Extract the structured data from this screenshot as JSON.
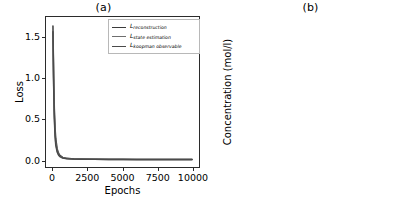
{
  "figure": {
    "panel_a_title": "(a)",
    "panel_b_title": "(b)"
  },
  "chart_data": [
    {
      "type": "line",
      "title": "(a)",
      "xlabel": "Epochs",
      "ylabel": "Loss",
      "xlim": [
        -500,
        10500
      ],
      "ylim": [
        -0.09,
        1.75
      ],
      "xticks": [
        0,
        2500,
        5000,
        7500,
        10000
      ],
      "xtick_labels": [
        "0",
        "2500",
        "5000",
        "7500",
        "10000"
      ],
      "yticks": [
        0.0,
        0.5,
        1.0,
        1.5
      ],
      "ytick_labels": [
        "0.0",
        "0.5",
        "1.0",
        "1.5"
      ],
      "grid": false,
      "legend_position": "upper right",
      "series": [
        {
          "name": "L_reconstruction",
          "label_base": "L",
          "label_sub": "reconstruction",
          "color": "#3b3b3b",
          "x": [
            0,
            50,
            100,
            150,
            200,
            300,
            400,
            500,
            700,
            1000,
            1500,
            2000,
            3000,
            4000,
            5000,
            6000,
            7000,
            8000,
            9000,
            10000
          ],
          "y": [
            1.64,
            1.02,
            0.62,
            0.39,
            0.26,
            0.135,
            0.08,
            0.052,
            0.028,
            0.016,
            0.009,
            0.007,
            0.005,
            0.004,
            0.004,
            0.003,
            0.003,
            0.003,
            0.003,
            0.003
          ]
        },
        {
          "name": "L_state estimation",
          "label_base": "L",
          "label_sub": "state estimation",
          "color": "#6e6e6e",
          "x": [
            0,
            50,
            100,
            150,
            200,
            300,
            400,
            500,
            700,
            1000,
            1500,
            2000,
            3000,
            4000,
            5000,
            6000,
            7000,
            8000,
            9000,
            10000
          ],
          "y": [
            1.6,
            0.95,
            0.55,
            0.33,
            0.21,
            0.11,
            0.065,
            0.043,
            0.023,
            0.013,
            0.008,
            0.006,
            0.004,
            0.003,
            0.003,
            0.003,
            0.002,
            0.002,
            0.002,
            0.002
          ]
        },
        {
          "name": "L_koopman observable",
          "label_base": "L",
          "label_sub": "koopman observable",
          "color": "#4a4a4a",
          "x": [
            0,
            50,
            100,
            150,
            200,
            300,
            400,
            500,
            700,
            1000,
            1500,
            2000,
            3000,
            4000,
            5000,
            6000,
            7000,
            8000,
            9000,
            10000
          ],
          "y": [
            1.57,
            0.9,
            0.5,
            0.29,
            0.18,
            0.095,
            0.057,
            0.037,
            0.02,
            0.012,
            0.007,
            0.005,
            0.004,
            0.003,
            0.003,
            0.002,
            0.002,
            0.002,
            0.002,
            0.002
          ]
        }
      ]
    },
    {
      "type": "line",
      "title": "(b)",
      "xlabel": "Time (s)",
      "ylabel": "Concentration (mol/l)",
      "xlim": [
        -1.5,
        31.5
      ],
      "ylim": [
        -0.05,
        1.07
      ],
      "xticks": [
        0,
        10,
        20,
        30
      ],
      "xtick_labels": [
        "0",
        "10",
        "20",
        "30"
      ],
      "yticks": [
        0.0,
        0.2,
        0.4,
        0.6,
        0.8,
        1.0
      ],
      "ytick_labels": [
        "0.0",
        "0.2",
        "0.4",
        "0.6",
        "0.8",
        "1.0"
      ],
      "grid": false,
      "legend_position": "upper right",
      "series": [
        {
          "name": "C_A predicted",
          "label_base": "C",
          "label_sub": "A",
          "label_tail": " predicted",
          "color": "#3b3b3b",
          "x": [
            0,
            0.5,
            1,
            1.5,
            2,
            3,
            4,
            5,
            6,
            8,
            10,
            12,
            14,
            16,
            18,
            20,
            24,
            27,
            30
          ],
          "y": [
            1.0,
            0.945,
            0.897,
            0.857,
            0.823,
            0.773,
            0.738,
            0.713,
            0.696,
            0.675,
            0.663,
            0.655,
            0.65,
            0.647,
            0.645,
            0.643,
            0.641,
            0.64,
            0.639
          ]
        },
        {
          "name": "C_A actual",
          "label_base": "C",
          "label_sub": "A",
          "label_tail": " actual",
          "color": "#777777",
          "x": [
            0,
            0.5,
            1,
            1.5,
            2,
            3,
            4,
            5,
            6,
            8,
            10,
            12,
            14,
            16,
            18,
            20,
            24,
            27,
            30
          ],
          "y": [
            1.0,
            0.938,
            0.885,
            0.841,
            0.804,
            0.75,
            0.712,
            0.686,
            0.668,
            0.645,
            0.632,
            0.624,
            0.619,
            0.616,
            0.614,
            0.612,
            0.611,
            0.61,
            0.61
          ]
        },
        {
          "name": "C_B predicted",
          "label_base": "C",
          "label_sub": "B",
          "label_tail": " predicted",
          "color": "#555555",
          "x": [
            0,
            0.5,
            1,
            1.5,
            2,
            3,
            4,
            5,
            6,
            8,
            10,
            12,
            14,
            16,
            18,
            20,
            24,
            27,
            30
          ],
          "y": [
            0.0,
            0.098,
            0.172,
            0.228,
            0.268,
            0.32,
            0.351,
            0.369,
            0.38,
            0.391,
            0.396,
            0.399,
            0.4,
            0.401,
            0.402,
            0.402,
            0.403,
            0.403,
            0.404
          ]
        },
        {
          "name": "C_B actual",
          "label_base": "C",
          "label_sub": "B",
          "label_tail": " actual",
          "color": "#8a8a8a",
          "x": [
            0,
            0.5,
            1,
            1.5,
            2,
            3,
            4,
            5,
            6,
            8,
            10,
            12,
            14,
            16,
            18,
            20,
            24,
            27,
            30
          ],
          "y": [
            0.0,
            0.092,
            0.161,
            0.213,
            0.251,
            0.3,
            0.329,
            0.346,
            0.356,
            0.366,
            0.371,
            0.373,
            0.374,
            0.375,
            0.375,
            0.376,
            0.376,
            0.377,
            0.377
          ]
        }
      ]
    }
  ]
}
